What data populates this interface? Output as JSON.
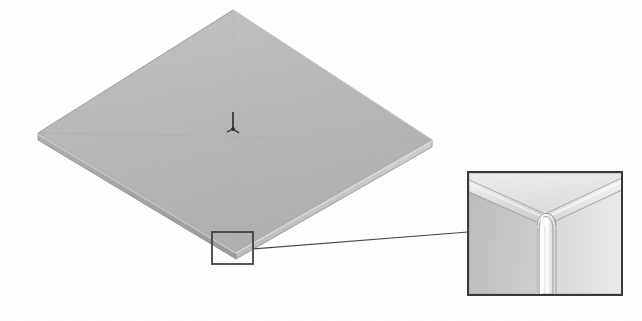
{
  "figure": {
    "background_color": "#fefefe",
    "caption": ""
  },
  "plate": {
    "name": "square-plate",
    "description": "Flat square plate shown in isometric projection",
    "top_face_color": "#b9b9b9",
    "left_edge_color": "#a6a6a6",
    "right_edge_color": "#c4c4c4",
    "outline_color": "#8e8e8e",
    "vertices": {
      "top": [
        233,
        10
      ],
      "right": [
        432,
        140
      ],
      "bottom": [
        236,
        252
      ],
      "left": [
        38,
        133
      ]
    },
    "thickness_px": 7,
    "seam_lines": "diagonal quarter seams meeting at center"
  },
  "axis_triad": {
    "name": "coordinate-axis-triad",
    "position": [
      233,
      124
    ],
    "color": "#2b2b2b",
    "axes": [
      "Z",
      "X",
      "Y"
    ]
  },
  "callout": {
    "source_box": {
      "name": "detail-source-box",
      "x": 212,
      "y": 232,
      "width": 41,
      "height": 32,
      "stroke_color": "#3a3a3a",
      "stroke_width": 1.6
    },
    "leader_line": {
      "name": "detail-leader-line",
      "from": [
        253,
        249
      ],
      "to": [
        468,
        232
      ],
      "stroke_color": "#4a4a4a",
      "stroke_width": 1.2
    },
    "detail_box": {
      "name": "detail-magnified-box",
      "x": 468,
      "y": 172,
      "width": 154,
      "height": 123,
      "stroke_color": "#3a3a3a",
      "stroke_width": 2,
      "fill": "#ffffff"
    },
    "detail_view": {
      "label": "",
      "description": "Magnified plate corner showing rounded bullnose vertical fillet edge",
      "top_face_color": "#e2e2e2",
      "chamfer_band_color": "#d2d2d2",
      "left_wall_color": "#c6c6c6",
      "right_wall_color": "#dcdcdc",
      "fillet_highlight_color": "#fbfbfb",
      "outline_color": "#8a8a8a"
    }
  },
  "colors": {
    "ink": "#3a3a3a",
    "light_gray": "#e2e2e2",
    "mid_gray": "#b9b9b9",
    "dark_gray": "#a0a0a0",
    "paper": "#fefefe"
  }
}
